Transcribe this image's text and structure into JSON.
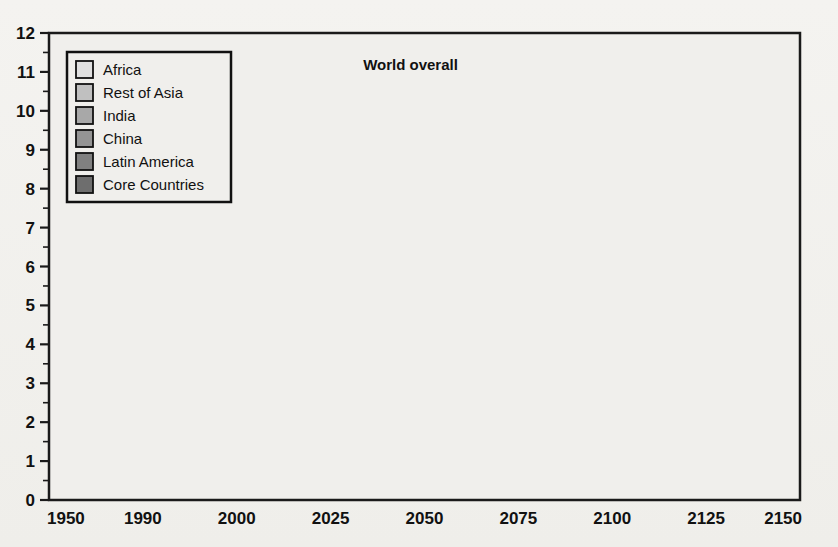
{
  "chart_data": {
    "type": "area",
    "stacked": true,
    "title": "",
    "xlabel": "",
    "ylabel": "",
    "categories": [
      "1950",
      "1990",
      "2000",
      "2025",
      "2050",
      "2075",
      "2100",
      "2125",
      "2150"
    ],
    "x_tick_labels": [
      "1950",
      "1990",
      "2000",
      "2025",
      "2050",
      "2075",
      "2100",
      "2125",
      "2150"
    ],
    "y_tick_labels": [
      "0",
      "1",
      "2",
      "3",
      "4",
      "5",
      "6",
      "7",
      "8",
      "9",
      "10",
      "11",
      "12"
    ],
    "ylim": [
      0,
      12
    ],
    "y_major_step": 1,
    "y_minor_step": 0.5,
    "grid": "both",
    "legend_position": "top-left",
    "annotations": [
      {
        "text": "World overall",
        "category": "2050",
        "value": 11.05
      }
    ],
    "series": [
      {
        "name": "Core Countries",
        "color": "#6e6e6e",
        "values": [
          0.3,
          0.72,
          0.78,
          1.22,
          1.05,
          0.98,
          0.95,
          0.93,
          0.92
        ]
      },
      {
        "name": "Latin America",
        "color": "#808080",
        "values": [
          0.72,
          1.38,
          1.48,
          2.12,
          2.25,
          2.3,
          2.35,
          2.4,
          2.45
        ]
      },
      {
        "name": "China",
        "color": "#949494",
        "values": [
          1.15,
          2.55,
          2.75,
          3.35,
          3.42,
          3.47,
          3.5,
          3.52,
          3.55
        ]
      },
      {
        "name": "India",
        "color": "#a8a8a8",
        "values": [
          1.52,
          3.4,
          3.7,
          4.78,
          5.3,
          5.52,
          5.62,
          5.72,
          5.8
        ]
      },
      {
        "name": "Rest of Asia",
        "color": "#c0c0c0",
        "values": [
          1.78,
          4.02,
          4.4,
          6.05,
          7.2,
          7.85,
          8.2,
          8.38,
          8.48
        ]
      },
      {
        "name": "Africa",
        "color": "#e0e0e0",
        "values": [
          2.45,
          5.18,
          6.22,
          8.45,
          10.2,
          11.0,
          11.42,
          11.65,
          11.78
        ]
      }
    ],
    "legend_entries": [
      {
        "label": "Africa",
        "color": "#e0e0e0"
      },
      {
        "label": "Rest of Asia",
        "color": "#c0c0c0"
      },
      {
        "label": "India",
        "color": "#a8a8a8"
      },
      {
        "label": "China",
        "color": "#949494"
      },
      {
        "label": "Latin America",
        "color": "#808080"
      },
      {
        "label": "Core Countries",
        "color": "#6e6e6e"
      }
    ],
    "colors": {
      "axis": "#1a1a1a",
      "grid": "#3d3d3d",
      "boundary_line": "#111111",
      "background": "#f2f1ee"
    }
  }
}
